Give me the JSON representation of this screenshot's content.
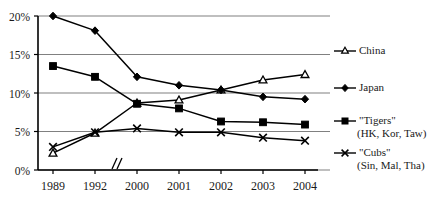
{
  "chart_data": {
    "type": "line",
    "title": "",
    "subtitle": "",
    "xlabel": "",
    "ylabel": "",
    "x": [
      "1989",
      "1992",
      "2000",
      "2001",
      "2002",
      "2003",
      "2004"
    ],
    "categories": [
      "1989",
      "1992",
      "2000",
      "2001",
      "2002",
      "2003",
      "2004"
    ],
    "ytick_labels": [
      "0%",
      "5%",
      "10%",
      "15%",
      "20%"
    ],
    "ytick_values": [
      0,
      5,
      10,
      15,
      20
    ],
    "ylim": [
      0,
      20
    ],
    "grid": "horizontal",
    "axis_break": "//",
    "axis_break_between": [
      "1992",
      "2000"
    ],
    "legend_position": "right",
    "series": [
      {
        "name": "China",
        "marker": "triangle-open",
        "values": [
          2.2,
          4.8,
          8.7,
          9.1,
          10.4,
          11.7,
          12.4
        ]
      },
      {
        "name": "Japan",
        "marker": "diamond-filled",
        "values": [
          20.0,
          18.1,
          12.1,
          11.0,
          10.4,
          9.5,
          9.2
        ]
      },
      {
        "name": "\"Tigers\"",
        "sublabel": "(HK, Kor, Taw)",
        "marker": "square-filled",
        "values": [
          13.5,
          12.1,
          8.6,
          8.0,
          6.3,
          6.2,
          5.9
        ]
      },
      {
        "name": "\"Cubs\"",
        "sublabel": "(Sin, Mal, Tha)",
        "marker": "x-cross",
        "values": [
          3.0,
          4.9,
          5.4,
          4.9,
          4.9,
          4.2,
          3.8
        ]
      }
    ]
  },
  "legend": {
    "entries": [
      {
        "label": "China",
        "sublabel": ""
      },
      {
        "label": "Japan",
        "sublabel": ""
      },
      {
        "label": "\"Tigers\"",
        "sublabel": "(HK, Kor, Taw)"
      },
      {
        "label": "\"Cubs\"",
        "sublabel": "(Sin, Mal, Tha)"
      }
    ]
  },
  "colors": {
    "line": "#000000",
    "grid": "#808080",
    "axis": "#000000",
    "background": "#ffffff",
    "text": "#1a1a1a"
  }
}
